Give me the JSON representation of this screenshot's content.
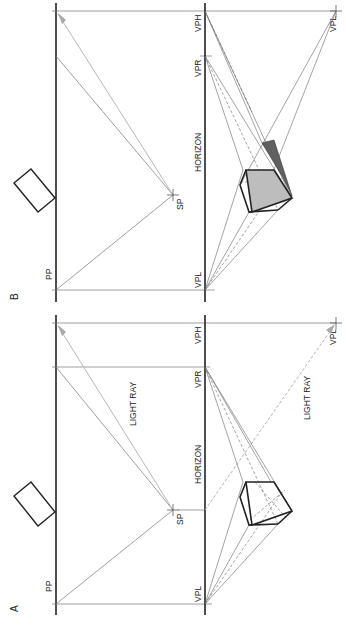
{
  "figure": {
    "panels": [
      {
        "id": "A",
        "label": "A",
        "pp_label": "PP",
        "sp_label": "SP",
        "horizon_label": "HORIZON",
        "vpl_label": "VPL",
        "vpr_label": "VPR",
        "vph_label": "VPH",
        "vpl_lower_label": "VPL",
        "light_ray_label_1": "LIGHT RAY",
        "light_ray_label_2": "LIGHT RAY",
        "shadow_shown": false
      },
      {
        "id": "B",
        "label": "B",
        "pp_label": "PP",
        "sp_label": "SP",
        "horizon_label": "HORIZON",
        "vpl_label": "VPL",
        "vpr_label": "VPR",
        "vph_label": "VPH",
        "vpl_lower_label": "VPL",
        "shadow_shown": true
      }
    ],
    "colors": {
      "ink": "#222222",
      "construction": "#777777",
      "light_ray": "#b8b8b8",
      "shadow_face": "#bdbdbd",
      "cast_shadow": "#606060"
    }
  }
}
